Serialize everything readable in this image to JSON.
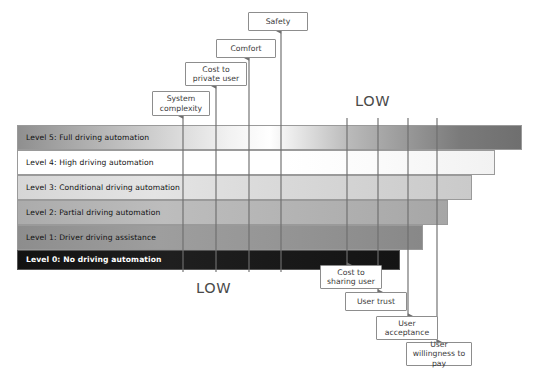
{
  "diagram": {
    "levels": [
      {
        "id": "level5",
        "label": "Level 5: Full driving automation",
        "tone": "light"
      },
      {
        "id": "level4",
        "label": "Level 4: High driving automation",
        "tone": "light"
      },
      {
        "id": "level3",
        "label": "Level 3: Conditional driving automation",
        "tone": "light"
      },
      {
        "id": "level2",
        "label": "Level 2: Partial driving automation",
        "tone": "light"
      },
      {
        "id": "level1",
        "label": "Level 1: Driver driving assistance",
        "tone": "light"
      },
      {
        "id": "level0",
        "label": "Level 0: No driving automation",
        "tone": "dark"
      }
    ],
    "top_factors": [
      {
        "id": "system-complexity",
        "label": "System complexity"
      },
      {
        "id": "cost-to-private-user",
        "label": "Cost to private user"
      },
      {
        "id": "comfort",
        "label": "Comfort"
      },
      {
        "id": "safety",
        "label": "Safety"
      }
    ],
    "bottom_factors": [
      {
        "id": "cost-to-sharing-user",
        "label": "Cost to sharing user"
      },
      {
        "id": "user-trust",
        "label": "User trust"
      },
      {
        "id": "user-acceptance",
        "label": "User acceptance"
      },
      {
        "id": "user-willingness-to-pay",
        "label": "User willingness to pay"
      }
    ],
    "captions": {
      "low_top": "LOW",
      "low_bottom": "LOW"
    },
    "colors": {
      "level0": "#1a1a1a",
      "level1": "#8f8f8f",
      "level2": "#a8a8a8",
      "level3": "#d2d2d2",
      "level4": "#ffffff",
      "level5": "#8a8a8a",
      "border": "#9a9a9a",
      "line": "#6e6e6e",
      "box_border": "#8d8d8d",
      "text": "#3a3a3a"
    }
  }
}
